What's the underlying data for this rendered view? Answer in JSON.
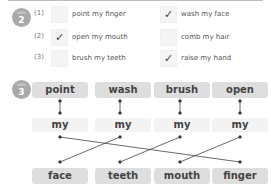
{
  "step2": {
    "badge_label": "STEP",
    "badge_number": "2",
    "items": [
      {
        "num": "(1)",
        "left": {
          "text": "point my finger",
          "checked": false,
          "mark": ""
        },
        "right": {
          "text": "wash my face",
          "checked": true,
          "mark": "✓"
        }
      },
      {
        "num": "(2)",
        "left": {
          "text": "open my mouth",
          "checked": true,
          "mark": "✓"
        },
        "right": {
          "text": "comb my hair",
          "checked": false,
          "mark": ""
        }
      },
      {
        "num": "(3)",
        "left": {
          "text": "brush my teeth",
          "checked": false,
          "mark": ""
        },
        "right": {
          "text": "raise my hand",
          "checked": true,
          "mark": "✓"
        }
      }
    ]
  },
  "step3": {
    "badge_label": "STEP",
    "badge_number": "3",
    "verbs": [
      "point",
      "wash",
      "brush",
      "open"
    ],
    "middle": [
      "my",
      "my",
      "my",
      "my"
    ],
    "nouns": [
      "face",
      "teeth",
      "mouth",
      "finger"
    ],
    "connections": [
      {
        "from": "point",
        "to": "finger"
      },
      {
        "from": "wash",
        "to": "face"
      },
      {
        "from": "brush",
        "to": "teeth"
      },
      {
        "from": "open",
        "to": "mouth"
      }
    ]
  }
}
